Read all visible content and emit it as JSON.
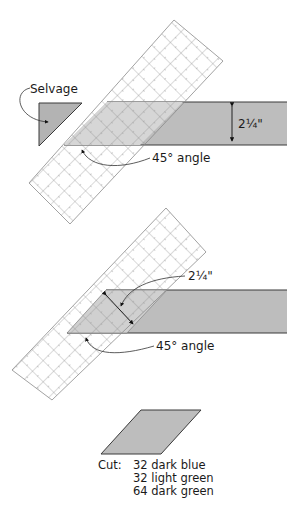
{
  "diagram": {
    "step1": {
      "selvage_label": "Selvage",
      "width_label": "2¼\"",
      "angle_label": "45° angle"
    },
    "step2": {
      "width_label": "2¼\"",
      "angle_label": "45° angle"
    },
    "result": {
      "cut_prefix": "Cut:",
      "cut_lines": [
        "32 dark blue",
        "32 light green",
        "64 dark green"
      ]
    },
    "colors": {
      "fabric": "#bdbdbd",
      "fabric_overlap": "#d4d4d4",
      "ruler_grid": "#8a8a8a",
      "outline": "#3a3a3a"
    }
  }
}
